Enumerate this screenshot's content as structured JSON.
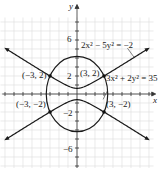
{
  "chart_data": {
    "type": "line",
    "title": "",
    "xlabel": "x",
    "ylabel": "y",
    "xlim": [
      -8,
      8
    ],
    "ylim": [
      -8,
      8
    ],
    "grid": true,
    "y_tick_labels": [
      "6",
      "2",
      "-2",
      "-6"
    ],
    "curves": [
      {
        "name": "ellipse",
        "equation": "3x² + 2y² = 35"
      },
      {
        "name": "hyperbola",
        "equation": "2x² − 5y² = −2"
      }
    ],
    "intersection_points": [
      {
        "label": "(3, 2)",
        "x": 3,
        "y": 2
      },
      {
        "label": "(−3, 2)",
        "x": -3,
        "y": 2
      },
      {
        "label": "(−3, −2)",
        "x": -3,
        "y": -2
      },
      {
        "label": "(3, −2)",
        "x": 3,
        "y": -2
      }
    ],
    "colors": {
      "curve": "#1a1a1a",
      "grid": "#d8d8d8",
      "axis": "#333333"
    }
  },
  "labels": {
    "x_axis": "x",
    "y_axis": "y",
    "tick_6": "6",
    "tick_2": "2",
    "tick_neg2": "−2",
    "tick_neg6": "−6",
    "eq_hyperbola": "2x² − 5y² = −2",
    "eq_ellipse": "3x² + 2y² = 35",
    "pt_q1": "(3, 2)",
    "pt_q2": "(−3, 2)",
    "pt_q3": "(−3, −2)",
    "pt_q4": "(3, −2)"
  }
}
